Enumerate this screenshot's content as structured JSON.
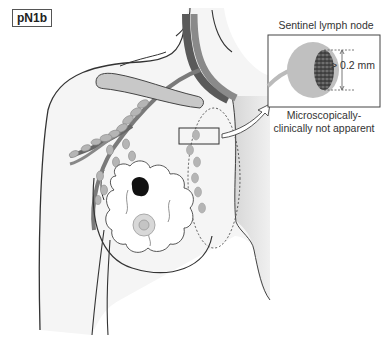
{
  "diagram": {
    "stage_label": "pN1b",
    "inset": {
      "title": "Sentinel lymph node",
      "measurement": "> 0.2 mm",
      "caption_line1": "Microscopically-",
      "caption_line2": "clinically not  apparent"
    },
    "elements": [
      "torso-outline",
      "arm-outline",
      "clavicle",
      "axillary-vessels",
      "axillary-lymph-nodes",
      "internal-mammary-lymph-nodes",
      "breast-glandular-tissue",
      "primary-tumor",
      "nipple-areola",
      "sentinel-node-highlight-box",
      "zoom-arrow",
      "sentinel-lymph-node-inset",
      "micrometastasis"
    ],
    "colors": {
      "outline": "#333333",
      "skin_fill": "#f4f4f4",
      "node_fill": "#b8b8b8",
      "vessel_dark": "#555555",
      "vessel_mid": "#888888",
      "tumor": "#111111",
      "sternum_shade": "#d0d0d0"
    }
  }
}
